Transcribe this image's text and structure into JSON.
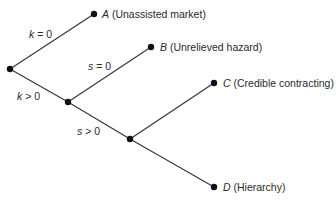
{
  "diagram": {
    "type": "decision-tree",
    "nodes": {
      "root": {
        "x": 10,
        "y": 69
      },
      "n2": {
        "x": 68,
        "y": 102
      },
      "n3": {
        "x": 130,
        "y": 139
      },
      "A": {
        "x": 94,
        "y": 14,
        "letter": "A",
        "label": " (Unassisted market)"
      },
      "B": {
        "x": 151,
        "y": 47,
        "letter": "B",
        "label": " (Unrelieved hazard)"
      },
      "C": {
        "x": 214,
        "y": 83,
        "letter": "C",
        "label": " (Credible contracting)"
      },
      "D": {
        "x": 214,
        "y": 187,
        "letter": "D",
        "label": " (Hierarchy)"
      }
    },
    "edge_labels": {
      "k0": {
        "var": "k",
        "rest": " = 0"
      },
      "kpos": {
        "var": "k",
        "rest": " > 0"
      },
      "s0": {
        "var": "s",
        "rest": " = 0"
      },
      "spos": {
        "var": "s",
        "rest": " > 0"
      }
    },
    "colors": {
      "line": "#333333",
      "node": "#111111",
      "text": "#2a2a2a"
    }
  }
}
